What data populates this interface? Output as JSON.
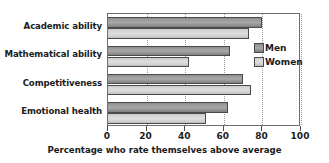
{
  "chart_data": {
    "type": "bar",
    "orientation": "horizontal",
    "title": "",
    "xlabel": "Percentage who rate themselves above average",
    "ylabel": "",
    "xlim": [
      0,
      100
    ],
    "xticks": [
      0,
      20,
      40,
      60,
      80,
      100
    ],
    "grid": true,
    "legend_position": "inside-right",
    "categories": [
      "Academic ability",
      "Mathematical ability",
      "Competitiveness",
      "Emotional health"
    ],
    "series": [
      {
        "name": "Men",
        "color": "#a0a0a0",
        "values": [
          80,
          63,
          70,
          62
        ]
      },
      {
        "name": "Women",
        "color": "#d8d8d8",
        "values": [
          73,
          42,
          74,
          51
        ]
      }
    ]
  },
  "legend": {
    "items": [
      {
        "label": "Men"
      },
      {
        "label": "Women"
      }
    ]
  },
  "axis": {
    "tick_labels": [
      "0",
      "20",
      "40",
      "60",
      "80",
      "100"
    ],
    "x_title": "Percentage who rate themselves above average"
  }
}
